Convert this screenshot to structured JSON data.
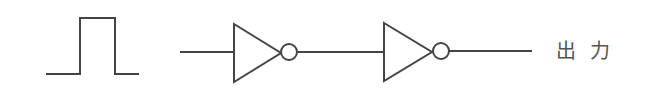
{
  "diagram": {
    "type": "logic-circuit",
    "stroke_color": "#444444",
    "text_color": "#555555",
    "input_signal": {
      "kind": "pulse",
      "points": [
        [
          46,
          74
        ],
        [
          80,
          74
        ],
        [
          80,
          18
        ],
        [
          115,
          18
        ],
        [
          115,
          74
        ],
        [
          139,
          74
        ]
      ]
    },
    "wires": [
      {
        "id": "input-wire",
        "x1": 180,
        "y1": 52,
        "x2": 234,
        "y2": 52
      },
      {
        "id": "middle-wire",
        "x1": 298,
        "y1": 52,
        "x2": 384,
        "y2": 52
      },
      {
        "id": "output-wire",
        "x1": 449,
        "y1": 51,
        "x2": 532,
        "y2": 51
      }
    ],
    "gates": [
      {
        "id": "inverter-1",
        "type": "NOT",
        "left": 234,
        "top": 24,
        "bottom": 82,
        "tip_x": 281,
        "mid_y": 53,
        "bubble_cx": 289,
        "bubble_cy": 52,
        "bubble_r": 8
      },
      {
        "id": "inverter-2",
        "type": "NOT",
        "left": 384,
        "top": 23,
        "bottom": 81,
        "tip_x": 432,
        "mid_y": 52,
        "bubble_cx": 441,
        "bubble_cy": 51,
        "bubble_r": 8
      }
    ],
    "output_label": "出力"
  }
}
